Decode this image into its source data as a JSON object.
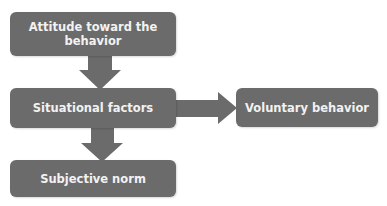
{
  "diagram": {
    "type": "flowchart",
    "colors": {
      "box_fill": "#6b6b6b",
      "arrow_fill": "#6b6b6b",
      "text": "#f2f2f2",
      "background": "#ffffff"
    },
    "nodes": [
      {
        "id": "attitude",
        "label": "Attitude toward the behavior"
      },
      {
        "id": "situational",
        "label": "Situational factors"
      },
      {
        "id": "voluntary",
        "label": "Voluntary behavior"
      },
      {
        "id": "subjective",
        "label": "Subjective norm"
      }
    ],
    "edges": [
      {
        "from": "attitude",
        "to": "situational",
        "direction": "down"
      },
      {
        "from": "situational",
        "to": "voluntary",
        "direction": "right"
      },
      {
        "from": "situational",
        "to": "subjective",
        "direction": "down"
      }
    ]
  }
}
